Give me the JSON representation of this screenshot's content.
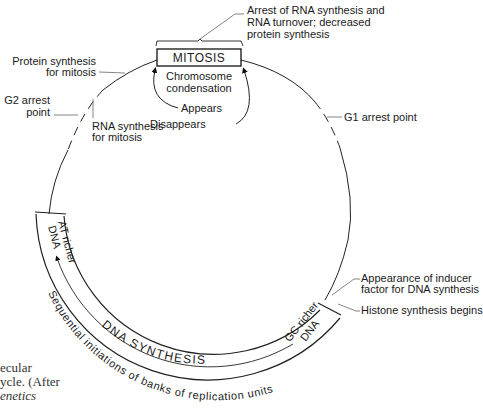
{
  "diagram": {
    "center_box": {
      "label": "MITOSIS",
      "sub_label_line1": "Chromosome",
      "sub_label_line2": "condensation",
      "appears": "Appears",
      "disappears": "Disappears"
    },
    "annotations": {
      "arrest_rna_line1": "Arrest of RNA synthesis and",
      "arrest_rna_line2": "RNA turnover; decreased",
      "arrest_rna_line3": "protein synthesis",
      "protein_synth_line1": "Protein synthesis",
      "protein_synth_line2": "for mitosis",
      "g2_arrest_line1": "G2 arrest",
      "g2_arrest_line2": "point",
      "rna_synth_line1": "RNA synthesis",
      "rna_synth_line2": "for mitosis",
      "g1_arrest": "G1 arrest point",
      "inducer_line1": "Appearance of inducer",
      "inducer_line2": "factor for DNA synthesis",
      "histone": "Histone synthesis begins"
    },
    "band": {
      "at_line1": "AT richer",
      "at_line2": "DNA",
      "gc_line1": "GC richer",
      "gc_line2": "DNA",
      "dna_synthesis": "DNA SYNTHESIS",
      "sequential": "Sequential initiations of banks of replication units"
    },
    "caption": {
      "line1": "ecular",
      "line2": "ycle. (After",
      "line3": "enetics"
    }
  }
}
